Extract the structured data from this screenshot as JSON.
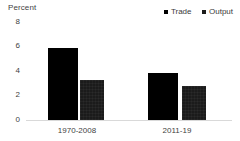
{
  "chart_data": {
    "type": "bar",
    "title": "",
    "xlabel": "",
    "ylabel": "Percent",
    "categories": [
      "1970-2008",
      "2011-19"
    ],
    "series": [
      {
        "name": "Trade",
        "values": [
          5.9,
          3.8
        ],
        "color": "#000000"
      },
      {
        "name": "Output",
        "values": [
          3.3,
          2.8
        ],
        "color": "#1b1b1b"
      }
    ],
    "ylim": [
      0,
      8
    ],
    "yticks": [
      0,
      2,
      4,
      6,
      8
    ],
    "ytick_labels": [
      "0",
      "2",
      "4",
      "6",
      "8"
    ],
    "grid": false,
    "legend_position": "top-right"
  },
  "axis": {
    "y_title": "Percent",
    "ticks": [
      {
        "label": "8",
        "value": 8
      },
      {
        "label": "6",
        "value": 6
      },
      {
        "label": "4",
        "value": 4
      },
      {
        "label": "2",
        "value": 2
      },
      {
        "label": "0",
        "value": 0
      }
    ]
  },
  "legend": {
    "items": [
      {
        "label": "Trade",
        "color": "#000000"
      },
      {
        "label": "Output",
        "color": "#1b1b1b"
      }
    ]
  },
  "categories": [
    {
      "label": "1970-2008"
    },
    {
      "label": "2011-19"
    }
  ],
  "bars": [
    {
      "group": "1970-2008",
      "series": "Trade",
      "value": 5.9
    },
    {
      "group": "1970-2008",
      "series": "Output",
      "value": 3.3
    },
    {
      "group": "2011-19",
      "series": "Trade",
      "value": 3.8
    },
    {
      "group": "2011-19",
      "series": "Output",
      "value": 2.8
    }
  ]
}
